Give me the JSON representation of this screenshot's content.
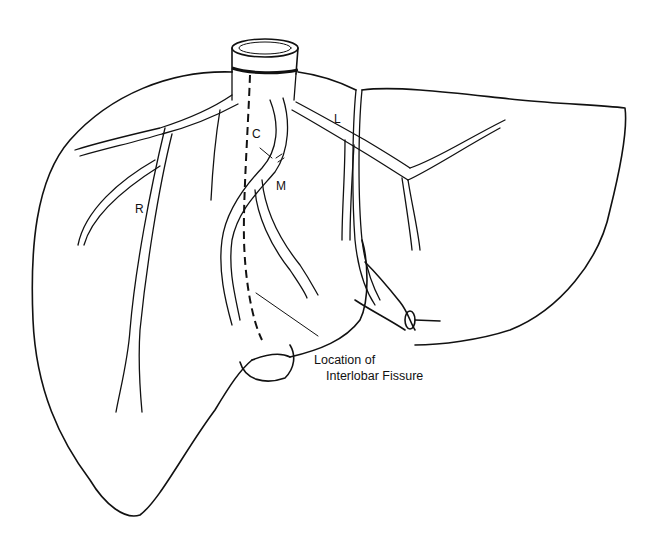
{
  "figure": {
    "labels": {
      "right_vein": "R",
      "middle_vein": "M",
      "left_vein": "L",
      "caudate": "C"
    },
    "annotation": {
      "line1": "Location of",
      "line2": "Interlobar Fissure"
    },
    "colors": {
      "stroke": "#111111",
      "background": "#ffffff"
    }
  }
}
